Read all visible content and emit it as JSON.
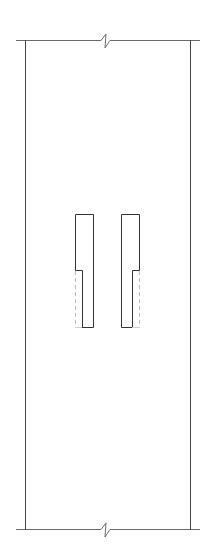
{
  "diagram": {
    "type": "architectural-section",
    "colors": {
      "background": "#ffffff",
      "line": "#555555",
      "hidden_line": "#bbbbbb"
    },
    "frame": {
      "top_y": 40,
      "bottom_y": 529,
      "left_x": 25,
      "right_x": 190,
      "extend_left_x": 16,
      "extend_right_x": 200
    },
    "break_symbols": [
      {
        "position": "top",
        "x": 107,
        "y": 40
      },
      {
        "position": "bottom",
        "x": 107,
        "y": 529
      }
    ],
    "openings": [
      {
        "side": "left",
        "outer_left": 75,
        "outer_right": 93,
        "top": 214,
        "step_y": 270,
        "step_x": 82,
        "bottom": 327
      },
      {
        "side": "right",
        "outer_left": 121,
        "outer_right": 139,
        "top": 214,
        "step_y": 270,
        "step_x": 132,
        "bottom": 327
      }
    ]
  }
}
